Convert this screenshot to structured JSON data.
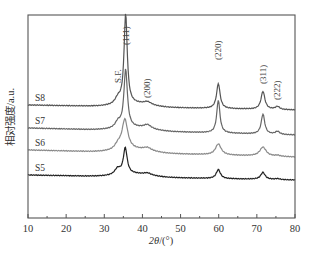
{
  "chart_data": {
    "type": "line",
    "title": "",
    "xlabel": "2θ/(°)",
    "xlabel_parts": {
      "italic": "2θ",
      "rest": "/(°)"
    },
    "ylabel": "相对强度/a.u.",
    "xlim": [
      10,
      80
    ],
    "xticks": [
      10,
      20,
      30,
      40,
      50,
      60,
      70,
      80
    ],
    "minor_xticks": [
      15,
      25,
      35,
      45,
      55,
      65,
      75
    ],
    "grid": false,
    "legend": "inline labels at left of each curve",
    "peak_annotations": [
      {
        "label": "S.F.",
        "x": 33.5
      },
      {
        "label": "(111)",
        "x": 35.6
      },
      {
        "label": "(200)",
        "x": 41.3
      },
      {
        "label": "(220)",
        "x": 59.9
      },
      {
        "label": "(311)",
        "x": 71.6
      },
      {
        "label": "(222)",
        "x": 75.4
      }
    ],
    "series": [
      {
        "name": "S8",
        "color": "#555555",
        "baseline_start": 105,
        "baseline_end": 110,
        "peaks": [
          [
            33.6,
            6,
            0.9
          ],
          [
            35.6,
            90,
            0.5
          ],
          [
            41.3,
            3,
            1.2
          ],
          [
            59.9,
            25,
            0.55
          ],
          [
            71.6,
            18,
            0.6
          ],
          [
            75.4,
            3,
            0.7
          ]
        ]
      },
      {
        "name": "S7",
        "color": "#666666",
        "baseline_start": 128,
        "baseline_end": 135,
        "peaks": [
          [
            33.6,
            6,
            0.9
          ],
          [
            35.6,
            58,
            0.55
          ],
          [
            41.3,
            4,
            1.2
          ],
          [
            59.9,
            33,
            0.5
          ],
          [
            71.6,
            20,
            0.55
          ],
          [
            75.4,
            3,
            0.7
          ]
        ]
      },
      {
        "name": "S6",
        "color": "#8a8a8a",
        "baseline_start": 150,
        "baseline_end": 157,
        "peaks": [
          [
            33.6,
            5,
            1.0
          ],
          [
            35.4,
            30,
            0.9
          ],
          [
            41.3,
            3,
            1.3
          ],
          [
            59.9,
            11,
            0.9
          ],
          [
            71.6,
            9,
            1.0
          ],
          [
            75.4,
            1,
            0.8
          ]
        ]
      },
      {
        "name": "S5",
        "color": "#222222",
        "baseline_start": 175,
        "baseline_end": 180,
        "peaks": [
          [
            33.5,
            6,
            0.9
          ],
          [
            35.5,
            26,
            0.6
          ],
          [
            41.3,
            2,
            1.2
          ],
          [
            59.9,
            9,
            0.65
          ],
          [
            71.6,
            7,
            0.7
          ],
          [
            75.4,
            1,
            0.7
          ]
        ]
      }
    ]
  },
  "plot": {
    "left": 28,
    "right": 295,
    "top": 15,
    "bottom": 218
  }
}
